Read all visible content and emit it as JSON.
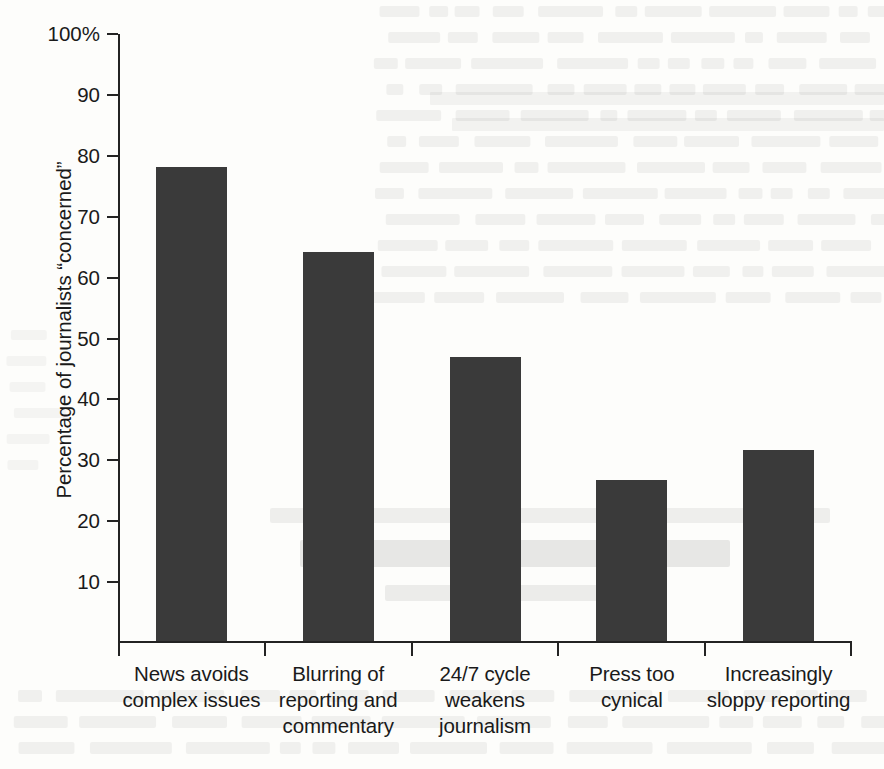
{
  "chart_data": {
    "type": "bar",
    "title": "",
    "xlabel": "",
    "ylabel": "Percentage of journalists “concerned”",
    "ylim": [
      0,
      100
    ],
    "grid": false,
    "legend": false,
    "bar_color": "#3a3a3a",
    "axis_color": "#232323",
    "y_ticks": [
      {
        "value": 100,
        "label": "100%"
      },
      {
        "value": 90,
        "label": "90"
      },
      {
        "value": 80,
        "label": "80"
      },
      {
        "value": 70,
        "label": "70"
      },
      {
        "value": 60,
        "label": "60"
      },
      {
        "value": 50,
        "label": "50"
      },
      {
        "value": 40,
        "label": "40"
      },
      {
        "value": 30,
        "label": "30"
      },
      {
        "value": 20,
        "label": "20"
      },
      {
        "value": 10,
        "label": "10"
      }
    ],
    "categories": [
      "News avoids complex issues",
      "Blurring of reporting and commentary",
      "24/7 cycle weakens journalism",
      "Press too cynical",
      "Increasingly sloppy reporting"
    ],
    "category_lines": [
      [
        "News avoids",
        "complex issues"
      ],
      [
        "Blurring of",
        "reporting and",
        "commentary"
      ],
      [
        "24/7 cycle",
        "weakens",
        "journalism"
      ],
      [
        "Press too",
        "cynical"
      ],
      [
        "Increasingly",
        "sloppy reporting"
      ]
    ],
    "values": [
      77.8,
      63.9,
      46.6,
      26.4,
      31.4
    ]
  }
}
